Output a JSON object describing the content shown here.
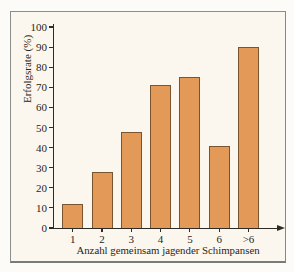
{
  "figure": {
    "kind": "statistics-bar-chart"
  },
  "chart_data": {
    "type": "bar",
    "title": "",
    "categories": [
      "1",
      "2",
      "3",
      "4",
      "5",
      "6",
      ">6"
    ],
    "values": [
      12,
      28,
      48,
      71,
      75,
      41,
      90
    ],
    "xlabel": "Anzahl gemeinsam jagender Schimpansen",
    "ylabel": "Erfolgsrate (%)",
    "ylim": [
      0,
      100
    ],
    "yticks": [
      0,
      10,
      20,
      30,
      40,
      50,
      60,
      70,
      80,
      90,
      100
    ],
    "grid": false,
    "legend_position": "none",
    "x_axis_arrow": true
  },
  "colors": {
    "bar_fill": "#e39a59",
    "bar_border": "#7a542e",
    "axis": "#2e2a26",
    "text": "#2a2520",
    "frame_border": "#8d8d8d",
    "frame_bg": "#fbf7ee",
    "page_bg": "#fcfbf7"
  }
}
